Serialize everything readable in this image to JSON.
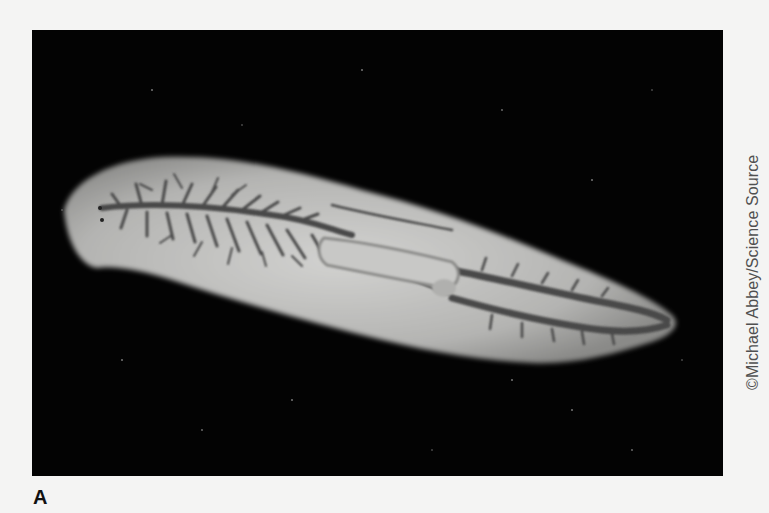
{
  "figure": {
    "panel_label": "A",
    "credit": "©Michael Abbey/Science Source",
    "photo": {
      "subject": "planarian flatworm",
      "description": "Black-and-white micrograph of a flatworm on a black background showing branched gastrovascular cavity and central pharynx",
      "background_color": "#030303",
      "body_color": "#b8b8b6",
      "gut_color": "#4a4a4a"
    }
  }
}
